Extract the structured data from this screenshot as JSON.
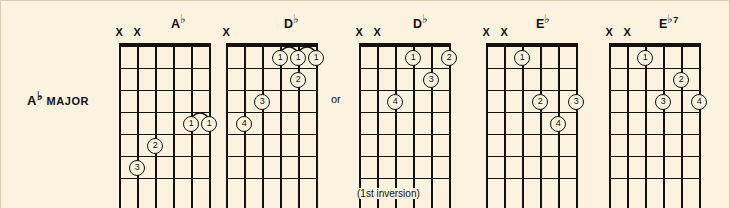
{
  "page": {
    "background_color": "#fbf2e0",
    "ink_color": "#14110c"
  },
  "label": {
    "root": "A",
    "accidental": "♭",
    "quality": "MAJOR",
    "full": "A♭ MAJOR"
  },
  "connector": {
    "or": "or"
  },
  "diagrams": [
    {
      "name": "ab-open",
      "title_root": "A",
      "title_accidental": "♭",
      "title_suffix": "",
      "title_full": "A♭",
      "left": 118,
      "title_left": 52,
      "strings": 6,
      "frets": 6,
      "muted": [
        "X",
        "X"
      ],
      "mute_positions": [
        0,
        1
      ],
      "fingerings": [
        {
          "finger": "1",
          "string": 4,
          "fret": 4
        },
        {
          "finger": "1",
          "string": 5,
          "fret": 4
        },
        {
          "finger": "2",
          "string": 2,
          "fret": 5
        },
        {
          "finger": "3",
          "string": 1,
          "fret": 6
        }
      ],
      "barres": [
        {
          "from_string": 4,
          "to_string": 5,
          "fret": 4
        }
      ],
      "caption": ""
    },
    {
      "name": "db-barre",
      "title_root": "D",
      "title_accidental": "♭",
      "title_suffix": "",
      "title_full": "D♭",
      "left": 225,
      "title_left": 58,
      "strings": 6,
      "frets": 6,
      "muted": [
        "X"
      ],
      "mute_positions": [
        0
      ],
      "fingerings": [
        {
          "finger": "1",
          "string": 3,
          "fret": 1
        },
        {
          "finger": "1",
          "string": 4,
          "fret": 1
        },
        {
          "finger": "1",
          "string": 5,
          "fret": 1
        },
        {
          "finger": "2",
          "string": 4,
          "fret": 2
        },
        {
          "finger": "3",
          "string": 2,
          "fret": 3
        },
        {
          "finger": "4",
          "string": 1,
          "fret": 4
        }
      ],
      "barres": [
        {
          "from_string": 3,
          "to_string": 5,
          "fret": 1
        }
      ],
      "caption": ""
    },
    {
      "name": "db-first-inversion",
      "title_root": "D",
      "title_accidental": "♭",
      "title_suffix": "",
      "title_full": "D♭",
      "left": 358,
      "title_left": 54,
      "strings": 6,
      "frets": 6,
      "muted": [
        "X",
        "X"
      ],
      "mute_positions": [
        0,
        1
      ],
      "fingerings": [
        {
          "finger": "1",
          "string": 3,
          "fret": 1
        },
        {
          "finger": "2",
          "string": 5,
          "fret": 1
        },
        {
          "finger": "3",
          "string": 4,
          "fret": 2
        },
        {
          "finger": "4",
          "string": 2,
          "fret": 3
        }
      ],
      "barres": [],
      "caption": "(1st inversion)"
    },
    {
      "name": "eb-major",
      "title_root": "E",
      "title_accidental": "♭",
      "title_suffix": "",
      "title_full": "E♭",
      "left": 485,
      "title_left": 50,
      "strings": 6,
      "frets": 6,
      "muted": [
        "X",
        "X"
      ],
      "mute_positions": [
        0,
        1
      ],
      "fingerings": [
        {
          "finger": "1",
          "string": 2,
          "fret": 1
        },
        {
          "finger": "2",
          "string": 3,
          "fret": 3
        },
        {
          "finger": "3",
          "string": 5,
          "fret": 3
        },
        {
          "finger": "4",
          "string": 4,
          "fret": 4
        }
      ],
      "barres": [],
      "caption": ""
    },
    {
      "name": "eb7",
      "title_root": "E",
      "title_accidental": "♭",
      "title_suffix": "7",
      "title_full": "E♭7",
      "left": 608,
      "title_left": 50,
      "strings": 6,
      "frets": 6,
      "muted": [
        "X",
        "X"
      ],
      "mute_positions": [
        0,
        1
      ],
      "fingerings": [
        {
          "finger": "1",
          "string": 2,
          "fret": 1
        },
        {
          "finger": "2",
          "string": 4,
          "fret": 2
        },
        {
          "finger": "3",
          "string": 3,
          "fret": 3
        },
        {
          "finger": "4",
          "string": 5,
          "fret": 3
        }
      ],
      "barres": [],
      "caption": ""
    }
  ],
  "geometry": {
    "board_top": 45,
    "string_gap": 18,
    "fret_gap": 22,
    "fret_count": 6,
    "string_count": 6,
    "string_overrun": 30
  }
}
